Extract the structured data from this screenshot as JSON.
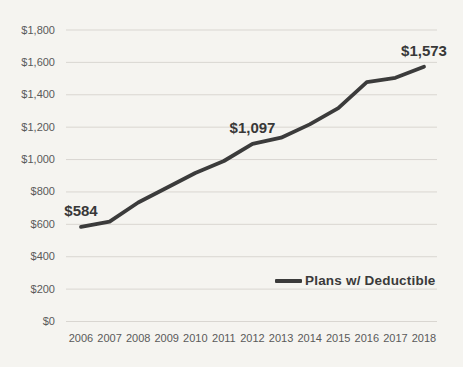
{
  "chart_data": {
    "type": "line",
    "title": "",
    "xlabel": "",
    "ylabel": "",
    "categories": [
      "2006",
      "2007",
      "2008",
      "2009",
      "2010",
      "2011",
      "2012",
      "2013",
      "2014",
      "2015",
      "2016",
      "2017",
      "2018"
    ],
    "series": [
      {
        "name": "Plans w/ Deductible",
        "color": "#3b3b3b",
        "values": [
          584,
          616,
          735,
          826,
          917,
          991,
          1097,
          1135,
          1217,
          1318,
          1478,
          1505,
          1573
        ]
      }
    ],
    "ylim": [
      0,
      1800
    ],
    "ytick_step": 200,
    "ytick_labels": [
      "$0",
      "$200",
      "$400",
      "$600",
      "$800",
      "$1,000",
      "$1,200",
      "$1,400",
      "$1,600",
      "$1,800"
    ],
    "grid": true,
    "legend": {
      "position": "inside-right",
      "entries": [
        "Plans w/ Deductible"
      ]
    },
    "annotations": [
      {
        "category": "2006",
        "text": "$584"
      },
      {
        "category": "2012",
        "text": "$1,097"
      },
      {
        "category": "2018",
        "text": "$1,573"
      }
    ],
    "colors": {
      "background": "#f5f4f0",
      "gridline": "#d9d6d1",
      "axis_text": "#5a5a5a",
      "line": "#3b3b3b",
      "data_label": "#383838"
    }
  }
}
